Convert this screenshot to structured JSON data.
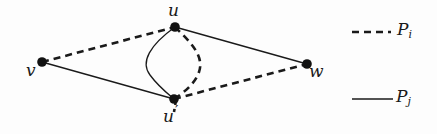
{
  "diagram": {
    "type": "graph",
    "nodes": [
      {
        "id": "v",
        "label": "v",
        "x": 42,
        "y": 62
      },
      {
        "id": "u",
        "label": "u",
        "x": 175,
        "y": 27
      },
      {
        "id": "u_prime",
        "label": "u",
        "prime": "′",
        "x": 174,
        "y": 99
      },
      {
        "id": "w",
        "label": "w",
        "x": 307,
        "y": 64
      }
    ],
    "edges": [
      {
        "from": "v",
        "to": "u",
        "path": "P_i",
        "style": "dashed"
      },
      {
        "from": "u",
        "to": "u_prime",
        "path": "P_i",
        "style": "dashed",
        "shape": "curve-right"
      },
      {
        "from": "u_prime",
        "to": "w",
        "path": "P_i",
        "style": "dashed"
      },
      {
        "from": "v",
        "to": "u_prime",
        "path": "P_j",
        "style": "solid"
      },
      {
        "from": "u",
        "to": "u_prime",
        "path": "P_j",
        "style": "solid",
        "shape": "curve-left"
      },
      {
        "from": "u",
        "to": "w",
        "path": "P_j",
        "style": "solid"
      }
    ],
    "colors": {
      "stroke": "#1a1a1a",
      "node_fill": "#111111",
      "background": "#fdfdfd"
    }
  },
  "labels": {
    "v": "v",
    "u": "u",
    "u_prime": "u",
    "prime_mark": "′",
    "w": "w"
  },
  "legend": {
    "items": [
      {
        "style": "dashed",
        "label": "P",
        "subscript": "i"
      },
      {
        "style": "solid",
        "label": "P",
        "subscript": "j"
      }
    ]
  }
}
